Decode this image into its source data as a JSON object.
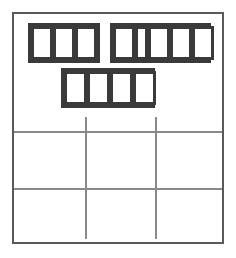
{
  "figure": {
    "background_color": "#ffffff",
    "canvas": {
      "width": 236,
      "height": 258
    }
  },
  "outer_frame": {
    "name": "outer-frame",
    "stroke_color": "#5a5a5a",
    "stroke_width": 2,
    "x": 12,
    "y": 12,
    "width": 212,
    "height": 232
  },
  "cell_groups": [
    {
      "id": "group-1",
      "label": "three-cell rod",
      "cell_count": 3,
      "x": 28,
      "y": 23,
      "width": 72,
      "height": 40,
      "cell_widths": [
        22,
        22,
        22
      ],
      "fill_color": "#ffffff",
      "stroke_color": "#3a3a3a"
    },
    {
      "id": "group-2",
      "label": "five-cell rod",
      "cell_count": 5,
      "x": 110,
      "y": 23,
      "width": 101,
      "height": 40,
      "cell_widths": [
        22,
        13,
        22,
        22,
        22
      ],
      "fill_color": "#ffffff",
      "stroke_color": "#3a3a3a"
    },
    {
      "id": "group-3",
      "label": "four-cell rod",
      "cell_count": 4,
      "x": 61,
      "y": 68,
      "width": 94,
      "height": 40,
      "cell_widths": [
        23,
        23,
        23,
        23
      ],
      "fill_color": "#ffffff",
      "stroke_color": "#3a3a3a"
    }
  ],
  "grid": {
    "label": "three by three grid",
    "line_color": "#8a8a8a",
    "line_width": 2,
    "horizontal_lines": [
      {
        "id": "h-line-1",
        "y": 131,
        "x_start": 14,
        "x_end": 222
      },
      {
        "id": "h-line-2",
        "y": 188,
        "x_start": 14,
        "x_end": 222
      }
    ],
    "vertical_lines": [
      {
        "id": "v-line-1",
        "x": 85,
        "y_start": 117,
        "y_end": 239
      },
      {
        "id": "v-line-2",
        "x": 155,
        "y_start": 117,
        "y_end": 239
      }
    ]
  }
}
